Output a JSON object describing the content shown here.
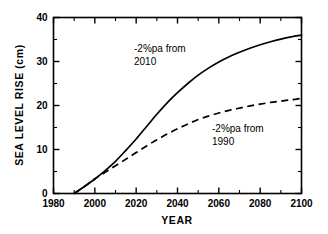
{
  "chart_data": {
    "type": "line",
    "title": "",
    "xlabel": "YEAR",
    "ylabel": "SEA LEVEL RISE (cm)",
    "xlim": [
      1980,
      2100
    ],
    "ylim": [
      0,
      40
    ],
    "x_major_ticks": [
      1980,
      2000,
      2020,
      2040,
      2060,
      2080,
      2100
    ],
    "x_minor_ticks": [
      1990,
      2010,
      2030,
      2050,
      2070,
      2090
    ],
    "y_major_ticks": [
      0,
      10,
      20,
      30,
      40
    ],
    "y_minor_ticks": [
      5,
      15,
      25,
      35
    ],
    "x_tick_labels": [
      "1980",
      "2000",
      "2020",
      "2040",
      "2060",
      "2080",
      "2100"
    ],
    "y_tick_labels": [
      "0",
      "10",
      "20",
      "30",
      "40"
    ],
    "grid": false,
    "legend": "none",
    "series": [
      {
        "name": "-2%pa from 2010",
        "style": "solid",
        "x": [
          1990,
          1995,
          2000,
          2005,
          2010,
          2015,
          2020,
          2025,
          2030,
          2035,
          2040,
          2045,
          2050,
          2055,
          2060,
          2065,
          2070,
          2075,
          2080,
          2085,
          2090,
          2095,
          2100
        ],
        "values": [
          0.0,
          1.6,
          3.3,
          5.2,
          7.3,
          9.8,
          12.4,
          15.2,
          18.0,
          20.6,
          22.9,
          25.0,
          26.9,
          28.5,
          29.9,
          31.1,
          32.1,
          33.0,
          33.8,
          34.5,
          35.1,
          35.6,
          36.0
        ]
      },
      {
        "name": "-2%pa from 1990",
        "style": "dashed",
        "x": [
          1990,
          1995,
          2000,
          2005,
          2010,
          2015,
          2020,
          2025,
          2030,
          2035,
          2040,
          2045,
          2050,
          2055,
          2060,
          2065,
          2070,
          2075,
          2080,
          2085,
          2090,
          2095,
          2100
        ],
        "values": [
          0.0,
          1.6,
          3.3,
          4.8,
          6.3,
          7.8,
          9.3,
          10.8,
          12.2,
          13.5,
          14.7,
          15.8,
          16.8,
          17.6,
          18.3,
          18.9,
          19.4,
          19.9,
          20.3,
          20.7,
          21.0,
          21.3,
          21.6
        ]
      }
    ],
    "annotations": [
      {
        "id": "annotation-upper",
        "line1": "-2%pa from",
        "line2": "2010",
        "x_px": 134,
        "y_px": 52
      },
      {
        "id": "annotation-lower",
        "line1": "-2%pa from",
        "line2": "1990",
        "x_px": 212,
        "y_px": 132
      }
    ],
    "colors": {
      "axis": "#000000",
      "series_solid": "#000000",
      "series_dashed": "#000000",
      "background": "#ffffff"
    }
  }
}
